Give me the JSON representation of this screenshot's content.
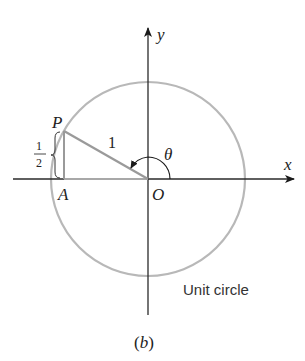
{
  "figure": {
    "caption": "(b)",
    "caption_letter": "b",
    "circle_label": "Unit circle",
    "axes": {
      "x_label": "x",
      "y_label": "y"
    },
    "points": {
      "P": "P",
      "A": "A",
      "O": "O"
    },
    "angle_label": "θ",
    "hypotenuse_label": "1",
    "side_label": {
      "numerator": "1",
      "denominator": "2"
    },
    "colors": {
      "axis": "#2a2a2a",
      "circle": "#b3b3b3",
      "triangle": "#9a9a9a",
      "text": "#222222"
    }
  }
}
